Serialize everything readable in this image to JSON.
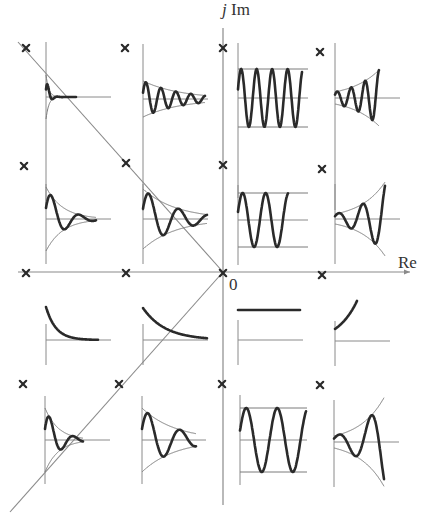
{
  "diagram": {
    "axes": {
      "real_label": "Re",
      "imag_label_j": "j",
      "imag_label_im": "Im",
      "origin_label": "0",
      "origin": [
        223,
        272
      ],
      "x_extent": [
        18,
        410
      ],
      "y_extent": [
        8,
        505
      ]
    },
    "colors": {
      "axis": "#8a8a8a",
      "curve": "#2a2a2a",
      "envelope": "#7a7a7a",
      "pole": "#2a2a2a",
      "text": "#333333"
    },
    "guide_lines": [
      {
        "name": "damping-line-upper",
        "from": [
          18,
          42
        ],
        "to": [
          223,
          272
        ]
      },
      {
        "name": "damping-line-lower",
        "from": [
          10,
          512
        ],
        "to": [
          223,
          272
        ]
      }
    ],
    "poles": [
      {
        "x": 26,
        "y": 48
      },
      {
        "x": 125,
        "y": 48
      },
      {
        "x": 223,
        "y": 48
      },
      {
        "x": 320,
        "y": 52
      },
      {
        "x": 24,
        "y": 166
      },
      {
        "x": 126,
        "y": 163
      },
      {
        "x": 223,
        "y": 165
      },
      {
        "x": 322,
        "y": 169
      },
      {
        "x": 26,
        "y": 273
      },
      {
        "x": 126,
        "y": 273
      },
      {
        "x": 223,
        "y": 273
      },
      {
        "x": 322,
        "y": 275
      },
      {
        "x": 23,
        "y": 384
      },
      {
        "x": 119,
        "y": 384
      },
      {
        "x": 222,
        "y": 384
      },
      {
        "x": 320,
        "y": 385
      }
    ],
    "responses": [
      {
        "name": "row1-col1",
        "type": "damped",
        "ox": 46,
        "oy": 97,
        "vaxis": [
          55,
          110
        ],
        "haxis": 65,
        "amp": 22,
        "decay": 0.16,
        "period": 10,
        "len": 30,
        "envelope": true
      },
      {
        "name": "row1-col2",
        "type": "damped",
        "ox": 143,
        "oy": 99,
        "vaxis": [
          55,
          112
        ],
        "haxis": 65,
        "amp": 18,
        "decay": 0.012,
        "period": 15,
        "len": 62,
        "envelope": true
      },
      {
        "name": "row1-col3",
        "type": "sustained",
        "ox": 238,
        "oy": 98,
        "vaxis": [
          55,
          100
        ],
        "haxis": 70,
        "amp": 29,
        "period": 15.5,
        "len": 64,
        "envelope": true
      },
      {
        "name": "row1-col4",
        "type": "growing",
        "ox": 335,
        "oy": 98,
        "vaxis": [
          55,
          112
        ],
        "haxis": 65,
        "amp": 6,
        "growth": 0.035,
        "period": 14,
        "len": 44,
        "envelope": true
      },
      {
        "name": "row2-col1",
        "type": "damped",
        "ox": 46,
        "oy": 219,
        "vaxis": [
          35,
          45
        ],
        "haxis": 65,
        "amp": 32,
        "decay": 0.06,
        "period": 28,
        "len": 50,
        "envelope": true
      },
      {
        "name": "row2-col2",
        "type": "damped",
        "ox": 143,
        "oy": 219,
        "vaxis": [
          35,
          45
        ],
        "haxis": 65,
        "amp": 30,
        "decay": 0.03,
        "period": 30,
        "len": 64,
        "envelope": true
      },
      {
        "name": "row2-col3",
        "type": "sustained",
        "ox": 238,
        "oy": 220,
        "vaxis": [
          35,
          45
        ],
        "haxis": 70,
        "amp": 27,
        "period": 23,
        "len": 50,
        "envelope": true
      },
      {
        "name": "row2-col4",
        "type": "growing",
        "ox": 335,
        "oy": 219,
        "vaxis": [
          35,
          45
        ],
        "haxis": 65,
        "amp": 5,
        "growth": 0.04,
        "period": 24,
        "len": 50,
        "envelope": true
      },
      {
        "name": "row3-col1",
        "type": "decay",
        "ox": 46,
        "oy": 340,
        "vaxis": [
          16,
          25
        ],
        "haxis": 65,
        "amp": 33,
        "decay": 0.1,
        "len": 52
      },
      {
        "name": "row3-col2",
        "type": "decay",
        "ox": 143,
        "oy": 340,
        "vaxis": [
          16,
          25
        ],
        "haxis": 65,
        "amp": 32,
        "decay": 0.045,
        "len": 64
      },
      {
        "name": "row3-col3",
        "type": "constant",
        "ox": 238,
        "oy": 340,
        "vaxis": [
          20,
          25
        ],
        "haxis": 65,
        "amp": 30,
        "len": 62
      },
      {
        "name": "row3-col4",
        "type": "rising",
        "ox": 335,
        "oy": 341,
        "vaxis": [
          20,
          25
        ],
        "haxis": 55,
        "amp": 14,
        "growth": 0.05,
        "len": 22
      },
      {
        "name": "row4-col1",
        "type": "damped",
        "ox": 45,
        "oy": 440,
        "vaxis": [
          44,
          44
        ],
        "haxis": 65,
        "amp": 32,
        "decay": 0.075,
        "period": 24,
        "len": 38,
        "envelope": true
      },
      {
        "name": "row4-col2",
        "type": "damped",
        "ox": 142,
        "oy": 440,
        "vaxis": [
          44,
          44
        ],
        "haxis": 64,
        "amp": 32,
        "decay": 0.03,
        "period": 32,
        "len": 54,
        "envelope": true
      },
      {
        "name": "row4-col3",
        "type": "sustained",
        "ox": 240,
        "oy": 440,
        "vaxis": [
          45,
          45
        ],
        "haxis": 67,
        "amp": 32,
        "period": 31,
        "len": 66,
        "envelope": true
      },
      {
        "name": "row4-col4",
        "type": "growing",
        "ox": 334,
        "oy": 442,
        "vaxis": [
          42,
          45
        ],
        "haxis": 65,
        "amp": 6,
        "growth": 0.04,
        "period": 32,
        "len": 50,
        "envelope": true
      }
    ]
  }
}
